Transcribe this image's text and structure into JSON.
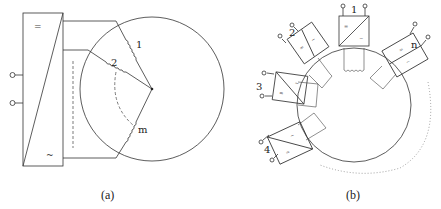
{
  "figure_a": {
    "caption": "(a)",
    "converter": {
      "dc_symbol": "=",
      "ac_symbol": "~"
    },
    "windings": [
      "1",
      "2",
      "m"
    ]
  },
  "figure_b": {
    "caption": "(b)",
    "modules": [
      {
        "label": "1",
        "dc_symbol": "=",
        "ac_symbol": "~"
      },
      {
        "label": "2",
        "dc_symbol": "=",
        "ac_symbol": "~"
      },
      {
        "label": "3",
        "dc_symbol": "=",
        "ac_symbol": "~"
      },
      {
        "label": "4",
        "dc_symbol": "=",
        "ac_symbol": "~"
      },
      {
        "label": "n",
        "dc_symbol": "=",
        "ac_symbol": "~"
      }
    ]
  }
}
